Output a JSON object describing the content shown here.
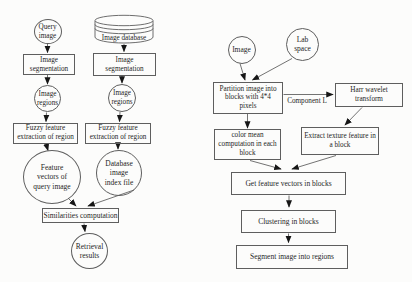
{
  "colors": {
    "ink": "#262626",
    "line": "#4f4f4f",
    "arrowhead": "#161616",
    "background": "#fcfcfb"
  },
  "left_flow": {
    "title_hint": "image retrieval pipeline",
    "query_image": "Query\nimage",
    "image_database": "Image database",
    "image_segmentation": "Image\nsegmentation",
    "image_regions": "Image\nregions",
    "fuzzy_feature": "Fuzzy feature\nextraction of region",
    "feature_vectors": "Feature\nvectors of\nquery image",
    "database_index": "Database\nimage\nindex file",
    "similarities": "Similarities computation",
    "retrieval": "Retrieval\nresults"
  },
  "right_flow": {
    "title_hint": "image segmentation pipeline",
    "image": "Image",
    "lab_space": "Lab\nspace",
    "partition": "Partition image into\nblocks with 4*4\npixels",
    "harr_wavelet": "Harr wavelet\ntransform",
    "component_l": "Component L",
    "color_mean": "color mean\ncomputation in each\nblock",
    "extract_texture": "Extract texture feature in\na block",
    "get_features": "Get feature vectors in blocks",
    "clustering": "Clustering in blocks",
    "segment": "Segment image into regions"
  }
}
